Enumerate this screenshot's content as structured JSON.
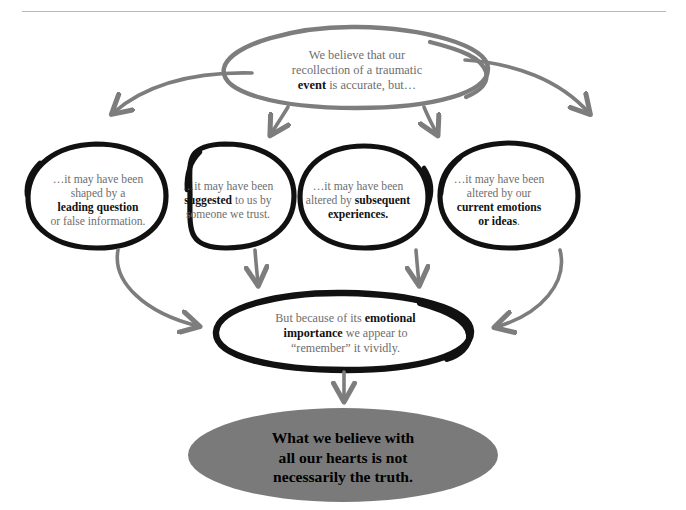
{
  "diagram": {
    "title_rule": "",
    "colors": {
      "gray_stroke": "#7d7d7d",
      "black_stroke": "#111111",
      "summary_fill": "#7a7a7a",
      "body_text": "#6e6e6e",
      "emphasis_text": "#111111",
      "rule": "#b8b8b8",
      "background": "#ffffff"
    },
    "top_node": {
      "line1": "We believe that our",
      "line2": "recollection of a traumatic",
      "line3_bold": "event",
      "line3_rest": " is accurate, but…"
    },
    "branch_nodes": [
      {
        "id": "leading-question",
        "line1": "…it may have been",
        "line2": "shaped by a",
        "line3_bold": "leading question",
        "line4": "or false information."
      },
      {
        "id": "suggested",
        "line1": "…it may have been",
        "line2_bold": "suggested",
        "line2_rest": " to us by",
        "line3": "someone we trust."
      },
      {
        "id": "subsequent-experiences",
        "line1": "…it may have been",
        "line2_rest": "altered by ",
        "line2_bold": "subsequent",
        "line3_bold": "experiences."
      },
      {
        "id": "current-emotions",
        "line1": "…it may have been",
        "line2": "altered by our",
        "line3_bold": "current emotions",
        "line4_bold": "or ideas",
        "line4_rest": "."
      }
    ],
    "convergence_node": {
      "line1_rest": "But because of its ",
      "line1_bold": "emotional",
      "line2_bold": "importance",
      "line2_rest": " we appear to",
      "line3": "“remember” it vividly."
    },
    "summary_node": {
      "line1": "What we believe with",
      "line2": "all our hearts is not",
      "line3": "necessarily the truth."
    }
  }
}
